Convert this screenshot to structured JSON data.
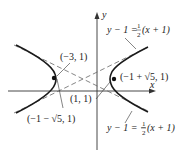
{
  "figure": {
    "type": "hyperbola-graph",
    "axes": {
      "x_label": "x",
      "y_label": "y"
    },
    "points": [
      {
        "label": "(−3, 1)",
        "name": "left-vertex"
      },
      {
        "label": "(−1 + √5, 1)",
        "name": "right-focus"
      },
      {
        "label": "(1, 1)",
        "name": "right-vertex"
      },
      {
        "label": "(−1 − √5, 1)",
        "name": "left-focus"
      }
    ],
    "asymptotes": [
      {
        "lhs": "y − 1 = ",
        "num": "1",
        "den": "2",
        "rhs": "(x + 1)",
        "name": "asymptote-positive"
      },
      {
        "lhs": "y − 1 = −",
        "num": "1",
        "den": "2",
        "rhs": "(x + 1)",
        "name": "asymptote-negative"
      }
    ],
    "colors": {
      "curve": "#1a1a1a",
      "asymptote": "#555555",
      "axis": "#333333"
    }
  }
}
